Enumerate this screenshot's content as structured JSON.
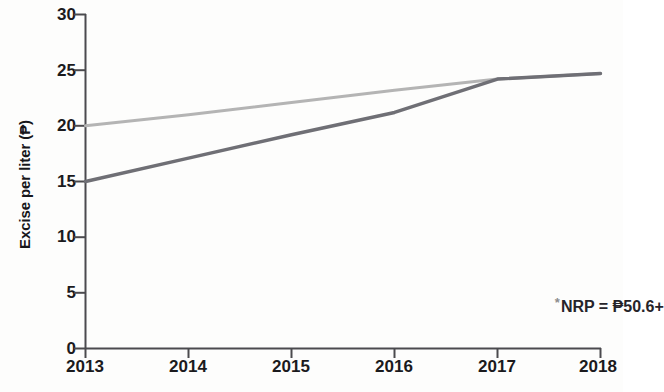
{
  "chart_data": {
    "type": "line",
    "title": "",
    "xlabel": "",
    "ylabel": "Excise per liter (₱)",
    "x": [
      2013,
      2014,
      2015,
      2016,
      2017,
      2018
    ],
    "xlim": [
      2013,
      2018
    ],
    "ylim": [
      0,
      30
    ],
    "x_ticks": [
      "2013",
      "2014",
      "2015",
      "2016",
      "2017",
      "2018"
    ],
    "y_ticks": [
      "0",
      "5",
      "10",
      "15",
      "20",
      "25",
      "30"
    ],
    "grid": false,
    "legend": "none",
    "series": [
      {
        "name": "upper-line",
        "color": "#b4b4b4",
        "values": [
          20.0,
          21.0,
          22.1,
          23.2,
          24.2,
          24.7
        ]
      },
      {
        "name": "lower-line",
        "color": "#6f6f75",
        "values": [
          15.0,
          17.1,
          19.2,
          21.2,
          24.2,
          24.7
        ]
      }
    ],
    "annotations": [
      {
        "name": "nrp-note",
        "star": "*",
        "text": "NRP = ₱50.6+",
        "x": 2017.78,
        "y": 4.1
      }
    ]
  },
  "axis": {
    "y_title": "Excise per liter (₱)"
  }
}
